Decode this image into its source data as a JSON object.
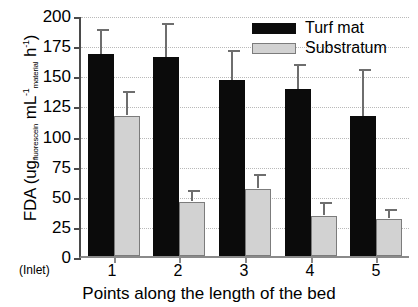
{
  "chart_data": {
    "type": "bar",
    "title": "",
    "xlabel": "Points along the length of the bed",
    "ylabel": "FDA (ug fluorescein mL-1 material h-1)",
    "categories": [
      "1",
      "2",
      "3",
      "4",
      "5"
    ],
    "x_end_labels": {
      "left": "(Inlet)",
      "right": "(Outlet)"
    },
    "ylim": [
      0,
      200
    ],
    "yticks": [
      0,
      25,
      50,
      75,
      100,
      125,
      150,
      175,
      200
    ],
    "ytick_labels": [
      "0",
      "25",
      "50",
      "75",
      "100",
      "125",
      "150",
      "175",
      "200"
    ],
    "grid": true,
    "legend_position": "top-right",
    "series": [
      {
        "name": "Turf mat",
        "color": "#0b0b0b",
        "values": [
          168,
          165,
          146,
          139,
          116
        ],
        "errors": [
          20,
          28,
          25,
          20,
          39
        ]
      },
      {
        "name": "Substratum",
        "color": "#d2d2d2",
        "values": [
          116,
          45,
          56,
          33,
          31
        ],
        "errors": [
          20,
          9,
          11,
          11,
          7
        ]
      }
    ]
  },
  "axis_title": {
    "main": "FDA (ug",
    "sub1": "fluorescein",
    "mid": " mL",
    "sup1": "-1",
    "sub2": "material",
    "mid2": " h",
    "sup2": "-1",
    "close": ")"
  }
}
